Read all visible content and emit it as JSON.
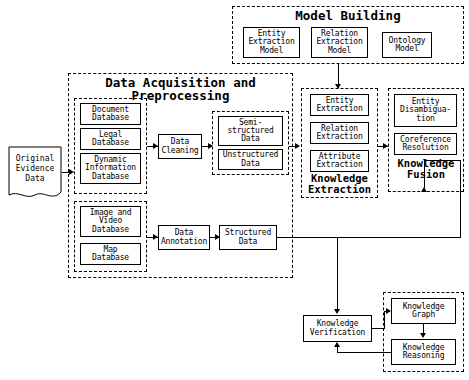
{
  "diagram": {
    "type": "flowchart"
  },
  "groups": {
    "model_building": {
      "label": "Model Building"
    },
    "data_acquisition": {
      "label": "Data Acquisition and\nPreprocessing"
    },
    "knowledge_extraction": {
      "label": "Knowledge\nExtraction"
    },
    "knowledge_fusion": {
      "label": "Knowledge\nFusion"
    },
    "text_sources": {
      "label": ""
    },
    "media_sources": {
      "label": ""
    },
    "cleaned_data": {
      "label": ""
    },
    "graph_group": {
      "label": ""
    }
  },
  "nodes": {
    "original_evidence_data": {
      "label": "Original\nEvidence\nData"
    },
    "document_database": {
      "label": "Document\nDatabase"
    },
    "legal_database": {
      "label": "Legal\nDatabase"
    },
    "dynamic_information_database": {
      "label": "Dynamic\nInformation\nDatabase"
    },
    "image_and_video_database": {
      "label": "Image and\nVideo\nDatabase"
    },
    "map_database": {
      "label": "Map\nDatabase"
    },
    "data_cleaning": {
      "label": "Data\nCleaning"
    },
    "data_annotation": {
      "label": "Data\nAnnotation"
    },
    "semi_structured_data": {
      "label": "Semi-\nstructured\nData"
    },
    "unstructured_data": {
      "label": "Unstructured\nData"
    },
    "structured_data": {
      "label": "Structured\nData"
    },
    "entity_extraction_model": {
      "label": "Entity\nExtraction\nModel"
    },
    "relation_extraction_model": {
      "label": "Relation\nExtraction\nModel"
    },
    "ontology_model": {
      "label": "Ontology\nModel"
    },
    "entity_extraction": {
      "label": "Entity\nExtraction"
    },
    "relation_extraction": {
      "label": "Relation\nExtraction"
    },
    "attribute_extraction": {
      "label": "Attribute\nExtraction"
    },
    "entity_disambiguation": {
      "label": "Entity\nDisambigua-\ntion"
    },
    "coreference_resolution": {
      "label": "Coreference\nResolution"
    },
    "knowledge_verification": {
      "label": "Knowledge\nVerification"
    },
    "knowledge_graph": {
      "label": "Knowledge\nGraph"
    },
    "knowledge_reasoning": {
      "label": "Knowledge\nReasoning"
    }
  },
  "colors": {
    "stroke": "#000000",
    "background": "#ffffff",
    "text": "#000000"
  }
}
